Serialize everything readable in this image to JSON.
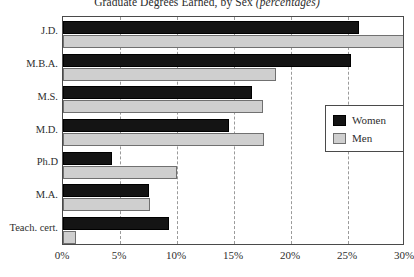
{
  "chart_data": {
    "type": "bar",
    "orientation": "horizontal",
    "title": "Graduate Degrees Earned, by Sex (percentages)",
    "title_plain": "Graduate Degrees Earned, by Sex ",
    "title_italic": "(percentages)",
    "xlabel": "",
    "ylabel": "",
    "categories": [
      "J.D.",
      "M.B.A.",
      "M.S.",
      "M.D.",
      "Ph.D",
      "M.A.",
      "Teach. cert."
    ],
    "series": [
      {
        "name": "Women",
        "color": "#141414",
        "values": [
          26.0,
          25.3,
          16.6,
          14.6,
          4.3,
          7.5,
          9.3
        ]
      },
      {
        "name": "Men",
        "color": "#cfcfcf",
        "values": [
          30.0,
          18.7,
          17.5,
          17.6,
          10.0,
          7.6,
          1.1
        ]
      }
    ],
    "xlim": [
      0,
      30
    ],
    "xticks": [
      0,
      5,
      10,
      15,
      20,
      25,
      30
    ],
    "xtick_labels": [
      "0%",
      "5%",
      "10%",
      "15%",
      "20%",
      "25%",
      "30%"
    ],
    "grid": "vertical-dashed",
    "legend_position": "right-middle"
  },
  "legend": {
    "items": [
      {
        "label": "Women",
        "swatch": "black"
      },
      {
        "label": "Men",
        "swatch": "gray"
      }
    ]
  }
}
